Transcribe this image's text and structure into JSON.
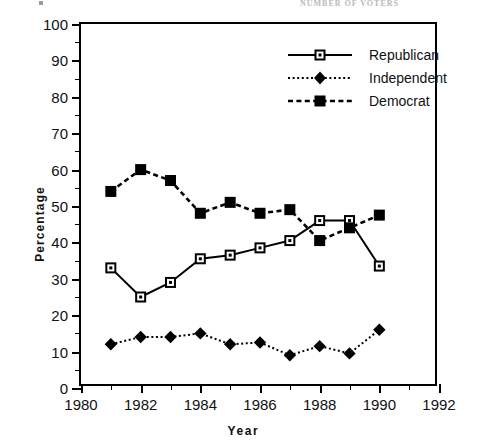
{
  "scan": {
    "header_text": "NUMBER OF VOTERS",
    "corner_mark": "tick"
  },
  "chart_data": {
    "type": "line",
    "title": "",
    "xlabel": "Year",
    "ylabel": "Percentage",
    "xlim": [
      1980,
      1992
    ],
    "ylim": [
      0,
      100
    ],
    "grid": false,
    "legend_position": "top-right",
    "x": [
      1981,
      1982,
      1983,
      1984,
      1985,
      1986,
      1987,
      1988,
      1989,
      1990
    ],
    "xticks_major": [
      1980,
      1982,
      1984,
      1986,
      1988,
      1990,
      1992
    ],
    "xticks_minor": [
      1981,
      1983,
      1985,
      1987,
      1989,
      1991
    ],
    "yticks_major": [
      0,
      10,
      20,
      30,
      40,
      50,
      60,
      70,
      80,
      90,
      100
    ],
    "yticks_minor": [
      5,
      15,
      25,
      35,
      45,
      55,
      65,
      75,
      85,
      95
    ],
    "series": [
      {
        "name": "Republican",
        "marker": "open-square",
        "line": "solid",
        "values": [
          33,
          25,
          29,
          35.5,
          36.5,
          38.5,
          40.5,
          46,
          46,
          33.5
        ]
      },
      {
        "name": "Independent",
        "marker": "filled-diamond",
        "line": "dotted",
        "values": [
          12,
          14,
          14,
          15,
          12,
          12.5,
          9,
          11.5,
          9.5,
          16
        ]
      },
      {
        "name": "Democrat",
        "marker": "filled-square",
        "line": "dashed",
        "values": [
          54,
          60,
          57,
          48,
          51,
          48,
          49,
          40.5,
          44,
          47.5
        ]
      }
    ]
  },
  "legend": {
    "items": [
      {
        "label": "Republican"
      },
      {
        "label": "Independent"
      },
      {
        "label": "Democrat"
      }
    ]
  },
  "colors": {
    "ink": "#000000",
    "background": "#ffffff",
    "faint": "#b9b9be"
  }
}
